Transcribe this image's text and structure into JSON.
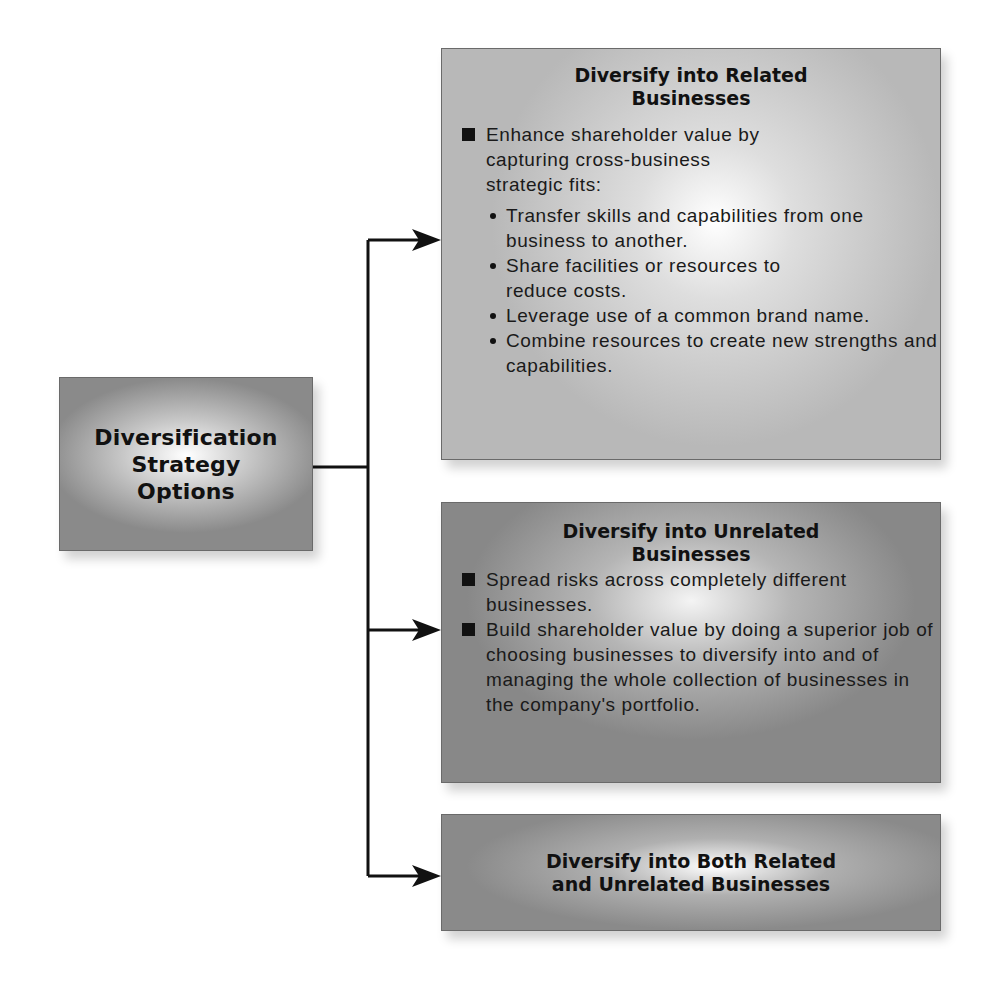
{
  "diagram": {
    "root": {
      "title_lines": [
        "Diversification",
        "Strategy",
        "Options"
      ]
    },
    "options": [
      {
        "title_lines": [
          "Diversify into Related",
          "Businesses"
        ],
        "bullets": [
          {
            "text": "Enhance shareholder value by capturing cross-business strategic fits:",
            "sub_bullets": [
              "Transfer skills and capabilities from one business to another.",
              "Share facilities or resources to reduce costs.",
              "Leverage use of a common brand name.",
              "Combine resources to create new strengths and capabilities."
            ]
          }
        ]
      },
      {
        "title_lines": [
          "Diversify into Unrelated",
          "Businesses"
        ],
        "bullets": [
          {
            "text": "Spread risks across completely different businesses."
          },
          {
            "text": "Build shareholder value by doing a superior job of choosing businesses to diversify into and of managing the whole collection of businesses in the company's portfolio."
          }
        ]
      },
      {
        "title_lines": [
          "Diversify into Both Related",
          "and Unrelated Businesses"
        ]
      }
    ],
    "colors": {
      "line": "#111111",
      "box_border": "#6a6a6a"
    }
  }
}
